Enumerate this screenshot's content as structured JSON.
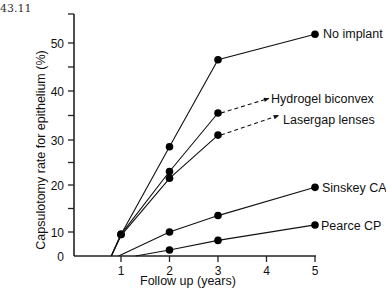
{
  "figure_number": "43.11",
  "chart_data": {
    "type": "line",
    "title": "",
    "xlabel": "Follow up (years)",
    "ylabel": "Capsulotomy rate for epithelium (%)",
    "xlim": [
      0,
      5
    ],
    "ylim": [
      0,
      55
    ],
    "x_ticks": [
      1,
      2,
      3,
      4,
      5
    ],
    "y_ticks_labeled": [
      0,
      10,
      20,
      30,
      40,
      50
    ],
    "y_ticks_minor": [
      15,
      25,
      35,
      45,
      55
    ],
    "grid": false,
    "legend": "direct labels at line ends",
    "series": [
      {
        "name": "No implant",
        "points": [
          [
            0.8,
            0
          ],
          [
            1,
            9
          ],
          [
            2,
            28.5
          ],
          [
            3,
            46.5
          ],
          [
            5,
            51.5
          ]
        ],
        "markers_at": [
          1,
          2,
          3,
          5
        ],
        "label_pos": "end"
      },
      {
        "name": "Hydrogel biconvex",
        "points": [
          [
            0.8,
            0
          ],
          [
            1,
            9
          ],
          [
            2,
            23
          ],
          [
            3,
            35.5
          ]
        ],
        "markers_at": [
          1,
          2,
          3
        ],
        "projection": {
          "style": "dashed-arrow",
          "to": [
            4.05,
            38.5
          ]
        }
      },
      {
        "name": "Lasergap lenses",
        "points": [
          [
            0.8,
            0
          ],
          [
            1,
            8.5
          ],
          [
            2,
            21.5
          ],
          [
            3,
            31
          ]
        ],
        "markers_at": [
          2,
          3
        ],
        "projection": {
          "style": "dashed-arrow",
          "to": [
            4.25,
            35
          ]
        }
      },
      {
        "name": "Sinskey CA",
        "points": [
          [
            0.95,
            0
          ],
          [
            2,
            10
          ],
          [
            3,
            13.5
          ],
          [
            5,
            19.5
          ]
        ],
        "markers_at": [
          2,
          3,
          5
        ]
      },
      {
        "name": "Pearce CP",
        "points": [
          [
            1.3,
            0
          ],
          [
            2,
            2.5
          ],
          [
            3,
            6.5
          ],
          [
            5,
            11.5
          ]
        ],
        "markers_at": [
          2,
          3,
          5
        ]
      }
    ]
  }
}
